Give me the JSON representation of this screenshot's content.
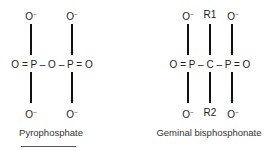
{
  "structures": [
    {
      "name": "Pyrophosphate",
      "top": [
        "O",
        "O"
      ],
      "top_charge": "−",
      "middle": "O = P – O – P = O",
      "bottom": [
        "O",
        "O"
      ],
      "bottom_charge": "−"
    },
    {
      "name": "Geminal bisphosphonate",
      "top": [
        "O",
        "R1",
        "O"
      ],
      "top_charge": "−",
      "middle": "O = P – C – P = O",
      "bottom": [
        "O",
        "R2",
        "O"
      ],
      "bottom_charge": "−"
    }
  ]
}
